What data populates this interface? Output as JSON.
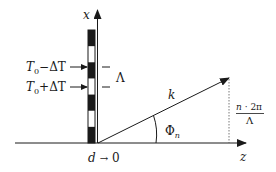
{
  "diagram": {
    "axis_x_label": "x",
    "axis_z_label": "z",
    "wave_vector_label": "k",
    "angle_label_main": "Φ",
    "angle_label_sub": "n",
    "grating_label_upper": {
      "T": "T",
      "sub": "0",
      "rest": "−ΔT"
    },
    "grating_label_lower": {
      "T": "T",
      "sub": "0",
      "rest": "+ΔT"
    },
    "period_label": "Λ",
    "thickness_label_var": "d",
    "thickness_label_arrow": "→",
    "thickness_label_value": "0",
    "fraction_numerator_var": "n",
    "fraction_numerator_rest": " · 2π",
    "fraction_denominator": "Λ",
    "grating_segments": [
      "black",
      "white",
      "black",
      "white",
      "black",
      "white",
      "black"
    ],
    "colors": {
      "ink": "#1a1a1a",
      "background": "#ffffff"
    }
  }
}
